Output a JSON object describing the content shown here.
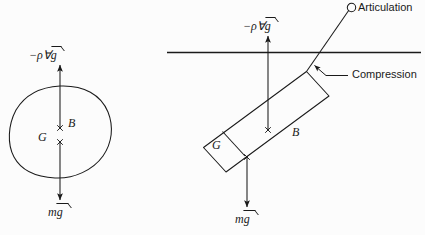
{
  "figure": {
    "panels": [
      {
        "id": "left",
        "name": "free-body-blob",
        "shape": "irregular-closed-blob",
        "labels": {
          "buoyancy_force": "−ρ∀g",
          "buoyancy_force_parts": {
            "prefix": "−ρ∀",
            "vector": "g"
          },
          "weight_force": "mg",
          "weight_force_parts": {
            "prefix": "m",
            "vector": "g"
          },
          "center_of_buoyancy": "B",
          "center_of_gravity": "G"
        },
        "markers": [
          {
            "name": "center-of-buoyancy-marker",
            "glyph": "×",
            "x": 60,
            "y": 128
          },
          {
            "name": "center-of-gravity-marker",
            "glyph": "×",
            "x": 60,
            "y": 142
          }
        ]
      },
      {
        "id": "right",
        "name": "articulated-rod",
        "shape": "tilted-rectangular-rod",
        "labels": {
          "buoyancy_force": "−ρ∀g",
          "buoyancy_force_parts": {
            "prefix": "−ρ∀",
            "vector": "g"
          },
          "weight_force": "mg",
          "weight_force_parts": {
            "prefix": "m",
            "vector": "g"
          },
          "center_of_buoyancy": "B",
          "center_of_gravity": "G",
          "articulation": "Articulation",
          "compression": "Compression"
        },
        "markers": [
          {
            "name": "center-of-buoyancy-marker",
            "glyph": "×",
            "x": 268,
            "y": 130
          },
          {
            "name": "center-of-gravity-marker",
            "glyph": "×",
            "x": 247,
            "y": 157
          }
        ],
        "free_surface": {
          "name": "water-free-surface-line",
          "y": 52,
          "x_start": 167,
          "x_end": 421
        }
      }
    ],
    "colors": {
      "stroke": "#1a1a1a",
      "background": "#fcfcfc",
      "text": "#1a1a1a"
    }
  }
}
